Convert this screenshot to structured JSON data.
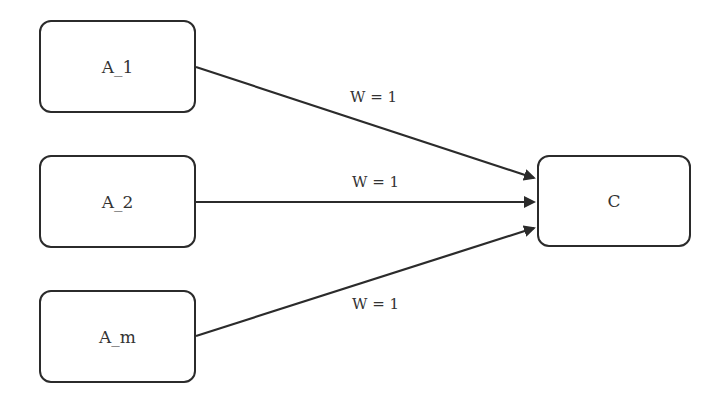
{
  "diagram": {
    "type": "weighted-graph",
    "nodes": [
      {
        "id": "a1",
        "label": "A_1"
      },
      {
        "id": "a2",
        "label": "A_2"
      },
      {
        "id": "am",
        "label": "A_m"
      },
      {
        "id": "c",
        "label": "C"
      }
    ],
    "edges": [
      {
        "from": "A_1",
        "to": "C",
        "label": "W = 1"
      },
      {
        "from": "A_2",
        "to": "C",
        "label": "W = 1"
      },
      {
        "from": "A_m",
        "to": "C",
        "label": "W = 1"
      }
    ]
  }
}
